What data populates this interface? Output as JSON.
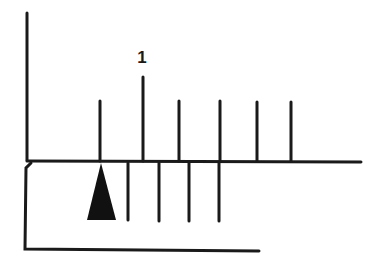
{
  "diagram": {
    "type": "vernier-scale",
    "colors": {
      "ink": "#1a1a1a",
      "background": "#ffffff"
    },
    "main_scale": {
      "label": "1",
      "tick_positions_x": [
        100,
        143,
        179,
        220,
        257,
        291
      ],
      "major_tick_index": 1
    },
    "vernier_scale": {
      "tick_positions_x": [
        128,
        160,
        188,
        219
      ],
      "pointer": "triangle-pointer"
    }
  }
}
